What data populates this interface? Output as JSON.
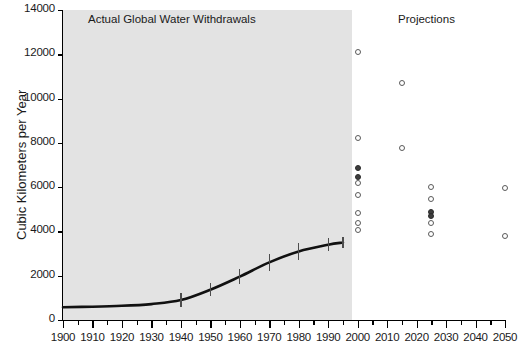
{
  "chart_data": {
    "type": "scatter",
    "title": "",
    "xlabel": "",
    "ylabel": "Cubic Kilometers per Year",
    "xlim": [
      1900,
      2050
    ],
    "ylim": [
      0,
      14000
    ],
    "grid": false,
    "legend": null,
    "annotations": [
      {
        "text": "Actual Global Water Withdrawals",
        "x": 1950,
        "y": 13300
      },
      {
        "text": "Projections",
        "x": 2018,
        "y": 13300
      }
    ],
    "xticks": [
      1900,
      1910,
      1920,
      1930,
      1940,
      1950,
      1960,
      1970,
      1980,
      1990,
      2000,
      2010,
      2020,
      2030,
      2040,
      2050
    ],
    "yticks": [
      0,
      2000,
      4000,
      6000,
      8000,
      10000,
      12000,
      14000
    ],
    "shaded_region": {
      "from": 1900,
      "to": 1998,
      "color": "#e3e3e3",
      "label": "Actual Global Water Withdrawals"
    },
    "series": [
      {
        "name": "Actual Global Water Withdrawals",
        "type": "line",
        "x": [
          1900,
          1910,
          1920,
          1930,
          1940,
          1950,
          1960,
          1970,
          1980,
          1990,
          1995
        ],
        "values": [
          580,
          600,
          640,
          720,
          900,
          1370,
          1960,
          2600,
          3100,
          3400,
          3500
        ],
        "errors": [
          0,
          0,
          0,
          0,
          300,
          300,
          350,
          400,
          400,
          300,
          250
        ]
      },
      {
        "name": "Projections 2000",
        "type": "scatter",
        "x": [
          2000,
          2000,
          2000,
          2000,
          2000,
          2000,
          2000,
          2000,
          2000
        ],
        "values": [
          12100,
          8200,
          6850,
          6450,
          6200,
          5650,
          4850,
          4400,
          4050
        ],
        "filled": [
          false,
          false,
          true,
          true,
          false,
          false,
          false,
          false,
          false
        ]
      },
      {
        "name": "Projections 2015",
        "type": "scatter",
        "x": [
          2015,
          2015
        ],
        "values": [
          10700,
          7750
        ],
        "filled": [
          false,
          false
        ]
      },
      {
        "name": "Projections 2025",
        "type": "scatter",
        "x": [
          2025,
          2025,
          2025,
          2025,
          2025,
          2025
        ],
        "values": [
          6000,
          5450,
          4900,
          4700,
          4400,
          3900
        ],
        "filled": [
          false,
          false,
          true,
          true,
          false,
          false
        ]
      },
      {
        "name": "Projections 2050",
        "type": "scatter",
        "x": [
          2050,
          2050
        ],
        "values": [
          5950,
          3800
        ],
        "filled": [
          false,
          false
        ]
      }
    ]
  },
  "axes": {
    "y_label": "Cubic Kilometers per Year",
    "y_tick_labels": [
      "14000",
      "12000",
      "10000",
      "8000",
      "6000",
      "4000",
      "2000",
      "0"
    ],
    "x_tick_labels": [
      "1900",
      "1910",
      "1920",
      "1930",
      "1940",
      "1950",
      "1960",
      "1970",
      "1980",
      "1990",
      "2000",
      "2010",
      "2020",
      "2030",
      "2040",
      "2050"
    ]
  },
  "labels": {
    "actual_region": "Actual Global Water Withdrawals",
    "projection_region": "Projections"
  },
  "colors": {
    "shade": "#e3e3e3",
    "curve": "#111111",
    "marker_stroke": "#5a5a5a",
    "marker_fill": "#3d3d3d",
    "axis": "#000000"
  }
}
